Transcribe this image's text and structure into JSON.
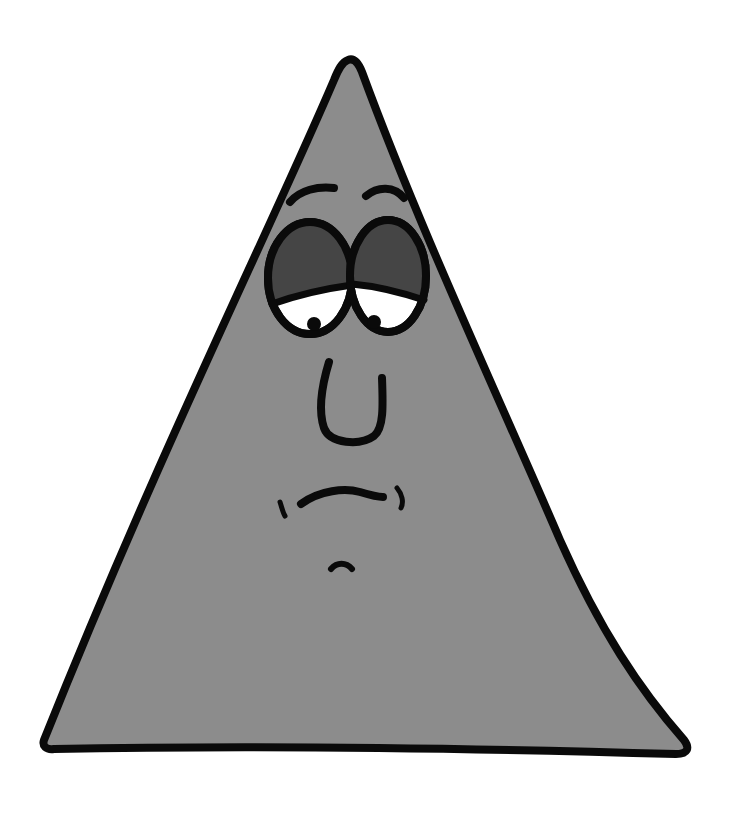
{
  "illustration": {
    "subject": "sad cartoon triangle",
    "alt": "Gray cartoon triangle character with droopy eyelids and a worried expression",
    "colors": {
      "background": "#ffffff",
      "body_fill": "#8c8c8c",
      "outline": "#0a0a0a",
      "eyelid_fill": "#454545",
      "eye_white": "#ffffff",
      "pupil": "#0a0a0a"
    },
    "features": [
      "eyebrows",
      "droopy-eyes",
      "pupils",
      "u-shaped-nose",
      "frowning-mouth",
      "mouth-dimples",
      "chin-mark"
    ]
  }
}
